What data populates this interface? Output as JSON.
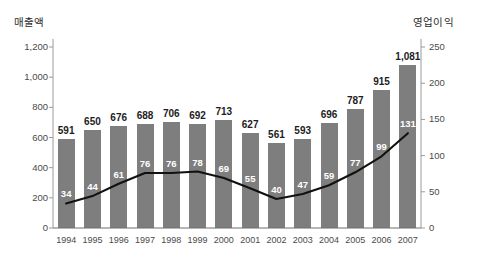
{
  "chart_data": {
    "type": "bar",
    "title": "",
    "xlabel": "",
    "categories": [
      "1994",
      "1995",
      "1996",
      "1997",
      "1998",
      "1999",
      "2000",
      "2001",
      "2002",
      "2003",
      "2004",
      "2005",
      "2006",
      "2007"
    ],
    "grid": false,
    "legend_position": "none",
    "axes": {
      "left": {
        "label": "매출액",
        "ticks": [
          "0",
          "200",
          "400",
          "600",
          "800",
          "1,000",
          "1,200"
        ],
        "tick_values": [
          0,
          200,
          400,
          600,
          800,
          1000,
          1200
        ],
        "ylim": [
          0,
          1200
        ]
      },
      "right": {
        "label": "영업이익",
        "ticks": [
          "0",
          "50",
          "100",
          "150",
          "200",
          "250"
        ],
        "tick_values": [
          0,
          50,
          100,
          150,
          200,
          250
        ],
        "ylim": [
          0,
          250
        ]
      }
    },
    "series": [
      {
        "name": "매출액",
        "kind": "bar",
        "axis": "left",
        "color": "#7e7e7e",
        "values": [
          591,
          650,
          676,
          688,
          706,
          692,
          713,
          627,
          561,
          593,
          696,
          787,
          915,
          1081
        ],
        "labels": [
          "591",
          "650",
          "676",
          "688",
          "706",
          "692",
          "713",
          "627",
          "561",
          "593",
          "696",
          "787",
          "915",
          "1,081"
        ]
      },
      {
        "name": "영업이익",
        "kind": "line",
        "axis": "right",
        "color": "#111111",
        "values": [
          34,
          44,
          61,
          76,
          76,
          78,
          69,
          55,
          40,
          47,
          59,
          77,
          99,
          131
        ],
        "labels": [
          "34",
          "44",
          "61",
          "76",
          "76",
          "78",
          "69",
          "55",
          "40",
          "47",
          "59",
          "77",
          "99",
          "131"
        ]
      }
    ]
  }
}
